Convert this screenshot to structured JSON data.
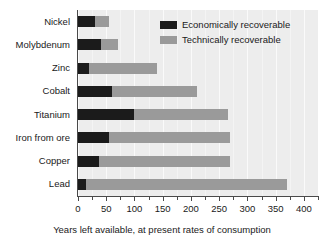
{
  "chart_data": {
    "type": "bar",
    "orientation": "horizontal",
    "stacked": true,
    "title": "",
    "xlabel": "Years left available, at present rates of consumption",
    "ylabel": "",
    "xlim": [
      0,
      425
    ],
    "xticks": [
      0,
      50,
      100,
      150,
      200,
      250,
      300,
      350,
      400
    ],
    "xtick_labels": [
      "0",
      "50",
      "100",
      "150",
      "200",
      "250",
      "300",
      "350",
      "400"
    ],
    "minor_tick_interval": 25,
    "grid": true,
    "legend_position": "upper right",
    "categories": [
      "Nickel",
      "Molybdenum",
      "Zinc",
      "Cobalt",
      "Titanium",
      "Iron from ore",
      "Copper",
      "Lead"
    ],
    "series": [
      {
        "name": "Economically recoverable",
        "color": "#1b1b1b",
        "values": [
          30,
          40,
          20,
          60,
          100,
          55,
          38,
          15
        ]
      },
      {
        "name": "Technically recoverable",
        "color": "#9a9a9a",
        "values": [
          55,
          70,
          140,
          210,
          265,
          270,
          270,
          370
        ]
      }
    ]
  },
  "legend": {
    "items": [
      {
        "label": "Economically recoverable",
        "color": "#1b1b1b"
      },
      {
        "label": "Technically recoverable",
        "color": "#9a9a9a"
      }
    ]
  },
  "axis": {
    "x_title": "Years left available, at present rates of consumption"
  },
  "colors": {
    "economically_recoverable": "#1b1b1b",
    "technically_recoverable": "#9a9a9a",
    "plot_background": "#ededed",
    "gridline": "#fafafa",
    "axis_line": "#4a4a4a",
    "text": "#1a1a1a"
  }
}
